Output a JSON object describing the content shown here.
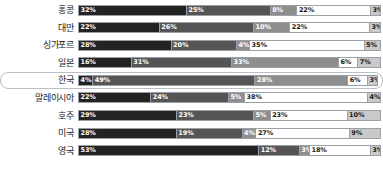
{
  "chart_data": {
    "type": "bar",
    "subtype": "stacked-horizontal-100",
    "title": "",
    "xlabel": "",
    "ylabel": "",
    "xlim": [
      0,
      100
    ],
    "grid": false,
    "legend": "none",
    "categories": [
      "홍콩",
      "대만",
      "싱가포르",
      "일본",
      "한국",
      "말레이시아",
      "호주",
      "미국",
      "영국"
    ],
    "highlighted_category": "한국",
    "series": [
      {
        "name": "segment-1",
        "color": "#232323",
        "values": [
          32,
          22,
          28,
          16,
          4,
          22,
          29,
          28,
          53
        ]
      },
      {
        "name": "segment-2",
        "color": "#555555",
        "values": [
          25,
          26,
          20,
          31,
          49,
          24,
          23,
          19,
          12
        ]
      },
      {
        "name": "segment-3",
        "color": "#8e8e8e",
        "values": [
          8,
          10,
          4,
          33,
          28,
          5,
          5,
          4,
          3
        ]
      },
      {
        "name": "segment-4",
        "color": "#ffffff",
        "values": [
          22,
          22,
          35,
          6,
          6,
          38,
          23,
          27,
          18
        ]
      },
      {
        "name": "segment-5",
        "color": "#c9c9c9",
        "values": [
          3,
          3,
          5,
          7,
          3,
          4,
          10,
          9,
          3
        ]
      }
    ],
    "rows": [
      {
        "label": "홍콩",
        "highlight": false,
        "segments": [
          {
            "value": 32,
            "text": "32%"
          },
          {
            "value": 25,
            "text": "25%"
          },
          {
            "value": 8,
            "text": "8%"
          },
          {
            "value": 22,
            "text": "22%"
          },
          {
            "value": 3,
            "text": "3%"
          }
        ]
      },
      {
        "label": "대만",
        "highlight": false,
        "segments": [
          {
            "value": 22,
            "text": "22%"
          },
          {
            "value": 26,
            "text": "26%"
          },
          {
            "value": 10,
            "text": "10%"
          },
          {
            "value": 22,
            "text": "22%"
          },
          {
            "value": 3,
            "text": "3%"
          }
        ]
      },
      {
        "label": "싱가포르",
        "highlight": false,
        "segments": [
          {
            "value": 28,
            "text": "28%"
          },
          {
            "value": 20,
            "text": "20%"
          },
          {
            "value": 4,
            "text": "4%"
          },
          {
            "value": 35,
            "text": "35%"
          },
          {
            "value": 5,
            "text": "5%"
          }
        ]
      },
      {
        "label": "일본",
        "highlight": false,
        "segments": [
          {
            "value": 16,
            "text": "16%"
          },
          {
            "value": 31,
            "text": "31%"
          },
          {
            "value": 33,
            "text": "33%"
          },
          {
            "value": 6,
            "text": "6%"
          },
          {
            "value": 7,
            "text": "7%"
          }
        ]
      },
      {
        "label": "한국",
        "highlight": true,
        "segments": [
          {
            "value": 4,
            "text": "4%"
          },
          {
            "value": 49,
            "text": "49%"
          },
          {
            "value": 28,
            "text": "28%"
          },
          {
            "value": 6,
            "text": "6%"
          },
          {
            "value": 3,
            "text": "3%"
          }
        ]
      },
      {
        "label": "말레이시아",
        "highlight": false,
        "segments": [
          {
            "value": 22,
            "text": "22%"
          },
          {
            "value": 24,
            "text": "24%"
          },
          {
            "value": 5,
            "text": "5%"
          },
          {
            "value": 38,
            "text": "38%"
          },
          {
            "value": 4,
            "text": "4%"
          }
        ]
      },
      {
        "label": "호주",
        "highlight": false,
        "segments": [
          {
            "value": 29,
            "text": "29%"
          },
          {
            "value": 23,
            "text": "23%"
          },
          {
            "value": 5,
            "text": "5%"
          },
          {
            "value": 23,
            "text": "23%"
          },
          {
            "value": 10,
            "text": "10%"
          }
        ]
      },
      {
        "label": "미국",
        "highlight": false,
        "segments": [
          {
            "value": 28,
            "text": "28%"
          },
          {
            "value": 19,
            "text": "19%"
          },
          {
            "value": 4,
            "text": "4%"
          },
          {
            "value": 27,
            "text": "27%"
          },
          {
            "value": 9,
            "text": "9%"
          }
        ]
      },
      {
        "label": "영국",
        "highlight": false,
        "segments": [
          {
            "value": 53,
            "text": "53%"
          },
          {
            "value": 12,
            "text": "12%"
          },
          {
            "value": 3,
            "text": "3%"
          },
          {
            "value": 18,
            "text": "18%"
          },
          {
            "value": 3,
            "text": "3%"
          }
        ]
      }
    ]
  }
}
